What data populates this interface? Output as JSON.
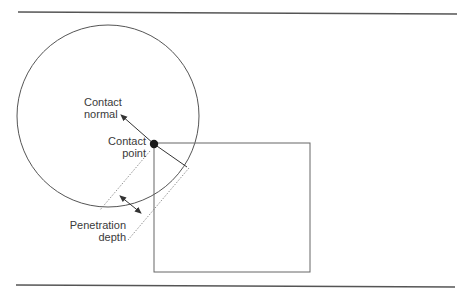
{
  "diagram": {
    "labels": {
      "contact_normal": [
        "Contact",
        "normal"
      ],
      "contact_point": [
        "Contact",
        "point"
      ],
      "penetration_depth": [
        "Penetration",
        "depth"
      ]
    },
    "shapes": {
      "circle": {
        "cx": 108,
        "cy": 116,
        "r": 91
      },
      "box": {
        "x": 154,
        "y": 143,
        "width": 156,
        "height": 129
      },
      "contact_point": {
        "x": 154,
        "y": 144
      }
    },
    "colors": {
      "stroke": "#555555",
      "text": "#3a3a3a",
      "dot": "#1a1a1a"
    }
  }
}
